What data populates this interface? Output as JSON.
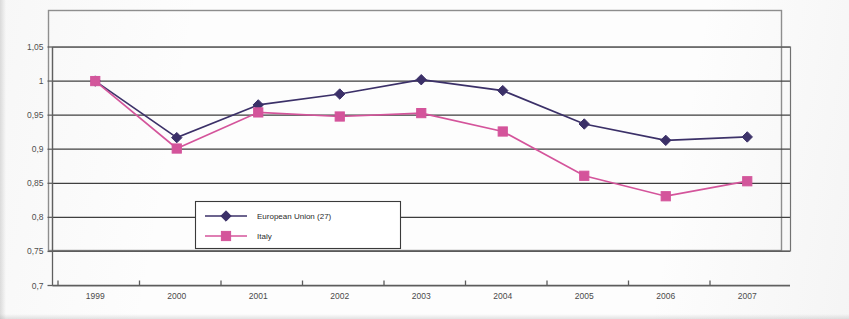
{
  "chart_data": {
    "type": "line",
    "title": "",
    "xlabel": "",
    "ylabel": "",
    "categories": [
      "1999",
      "2000",
      "2001",
      "2002",
      "2003",
      "2004",
      "2005",
      "2006",
      "2007"
    ],
    "series": [
      {
        "name": "European Union (27)",
        "color": "#3b3068",
        "marker": "diamond",
        "values": [
          1.0,
          0.917,
          0.965,
          0.981,
          1.002,
          0.986,
          0.937,
          0.913,
          0.918
        ]
      },
      {
        "name": "Italy",
        "color": "#d4549b",
        "marker": "square",
        "values": [
          1.0,
          0.901,
          0.954,
          0.948,
          0.953,
          0.926,
          0.861,
          0.831,
          0.853
        ]
      }
    ],
    "ylim": [
      0.7,
      1.05
    ],
    "ytick_labels": [
      "1,05",
      "1",
      "0,95",
      "0,9",
      "0,85",
      "0,8",
      "0,75",
      "0,7"
    ],
    "ytick_values": [
      1.05,
      1.0,
      0.95,
      0.9,
      0.85,
      0.8,
      0.75,
      0.7
    ],
    "xtick_labels": [
      "1999",
      "2000",
      "2001",
      "2002",
      "2003",
      "2004",
      "2005",
      "2006",
      "2007"
    ],
    "grid": true,
    "legend_position": "inside-lower-left"
  },
  "legend": {
    "entries": [
      {
        "label": "European Union (27)",
        "color": "#3b3068",
        "marker": "diamond"
      },
      {
        "label": "Italy",
        "color": "#d4549b",
        "marker": "square"
      }
    ]
  }
}
